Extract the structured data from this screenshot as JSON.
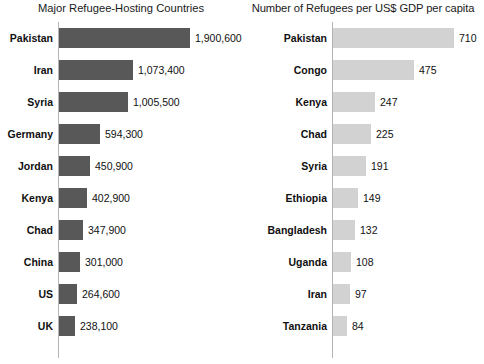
{
  "chart_data": [
    {
      "type": "bar",
      "orientation": "horizontal",
      "title": "Major Refugee-Hosting Countries",
      "xlabel": "",
      "ylabel": "",
      "grid": false,
      "legend": "none",
      "xlim": [
        0,
        1900600
      ],
      "categories": [
        "Pakistan",
        "Iran",
        "Syria",
        "Germany",
        "Jordan",
        "Kenya",
        "Chad",
        "China",
        "US",
        "UK"
      ],
      "values": [
        1900600,
        1073400,
        1005500,
        594300,
        450900,
        402900,
        347900,
        301000,
        264600,
        238100
      ],
      "value_labels": [
        "1,900,600",
        "1,073,400",
        "1,005,500",
        "594,300",
        "450,900",
        "402,900",
        "347,900",
        "301,000",
        "264,600",
        "238,100"
      ],
      "bar_color": "#585858"
    },
    {
      "type": "bar",
      "orientation": "horizontal",
      "title": "Number of Refugees per US$ GDP per capita",
      "xlabel": "",
      "ylabel": "",
      "grid": false,
      "legend": "none",
      "xlim": [
        0,
        710
      ],
      "categories": [
        "Pakistan",
        "Congo",
        "Kenya",
        "Chad",
        "Syria",
        "Ethiopia",
        "Bangladesh",
        "Uganda",
        "Iran",
        "Tanzania"
      ],
      "values": [
        710,
        475,
        247,
        225,
        191,
        149,
        132,
        108,
        97,
        84
      ],
      "value_labels": [
        "710",
        "475",
        "247",
        "225",
        "191",
        "149",
        "132",
        "108",
        "97",
        "84"
      ],
      "bar_color": "#d2d2d2"
    }
  ],
  "panels": {
    "left": {
      "title": "Major Refugee-Hosting Countries",
      "rows": [
        {
          "label": "Pakistan",
          "value": "1,900,600"
        },
        {
          "label": "Iran",
          "value": "1,073,400"
        },
        {
          "label": "Syria",
          "value": "1,005,500"
        },
        {
          "label": "Germany",
          "value": "594,300"
        },
        {
          "label": "Jordan",
          "value": "450,900"
        },
        {
          "label": "Kenya",
          "value": "402,900"
        },
        {
          "label": "Chad",
          "value": "347,900"
        },
        {
          "label": "China",
          "value": "301,000"
        },
        {
          "label": "US",
          "value": "264,600"
        },
        {
          "label": "UK",
          "value": "238,100"
        }
      ]
    },
    "right": {
      "title": "Number of Refugees per US$ GDP per capita",
      "rows": [
        {
          "label": "Pakistan",
          "value": "710"
        },
        {
          "label": "Congo",
          "value": "475"
        },
        {
          "label": "Kenya",
          "value": "247"
        },
        {
          "label": "Chad",
          "value": "225"
        },
        {
          "label": "Syria",
          "value": "191"
        },
        {
          "label": "Ethiopia",
          "value": "149"
        },
        {
          "label": "Bangladesh",
          "value": "132"
        },
        {
          "label": "Uganda",
          "value": "108"
        },
        {
          "label": "Iran",
          "value": "97"
        },
        {
          "label": "Tanzania",
          "value": "84"
        }
      ]
    }
  },
  "colors": {
    "left_bar": "#585858",
    "right_bar": "#d2d2d2",
    "axis": "#b4b4b4",
    "text": "#111111",
    "background": "#ffffff"
  }
}
